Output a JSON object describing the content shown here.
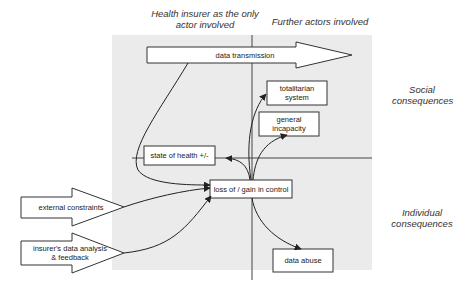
{
  "headers": {
    "left_column": "Health insurer as the only actor involved",
    "right_column": "Further actors involved",
    "top_row": "Social consequences",
    "bottom_row": "Individual consequences"
  },
  "nodes": {
    "data_transmission": "data transmission",
    "totalitarian_system": "totalitarian system",
    "general_incapacity": "general incapacity",
    "state_of_health": "state of health +/-",
    "loss_gain_control": "loss of / gain in control",
    "external_constraints": "external constraints",
    "insurer_analysis": "insurer's data analysis & feedback",
    "data_abuse": "data abuse"
  },
  "edges": [
    {
      "from": "data_transmission",
      "to": "loss_gain_control"
    },
    {
      "from": "external_constraints",
      "to": "loss_gain_control"
    },
    {
      "from": "insurer_analysis",
      "to": "loss_gain_control"
    },
    {
      "from": "loss_gain_control",
      "to": "state_of_health"
    },
    {
      "from": "loss_gain_control",
      "to": "totalitarian_system"
    },
    {
      "from": "loss_gain_control",
      "to": "general_incapacity"
    },
    {
      "from": "loss_gain_control",
      "to": "data_abuse"
    }
  ],
  "colors": {
    "panel_background": "#ebebeb",
    "stroke": "#333333",
    "box_fill": "#ffffff"
  }
}
